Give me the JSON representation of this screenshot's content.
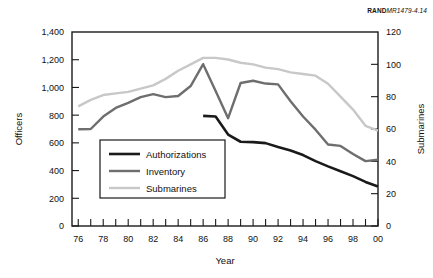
{
  "source_credit": {
    "bold": "RAND",
    "italic": "MR1479-4.14"
  },
  "chart_data": {
    "type": "line",
    "title": "",
    "subtitle": "",
    "xlabel": "Year",
    "ylabel": "Officers",
    "y2label": "Submarines",
    "grid": false,
    "legend_position": "inside-lower-left",
    "xlim": [
      76,
      100.5
    ],
    "ylim": [
      0,
      1400
    ],
    "y2lim": [
      0,
      120
    ],
    "x_tick_step": 1,
    "x_label_step": 2,
    "x_tick_labels": [
      "76",
      "77",
      "78",
      "79",
      "80",
      "81",
      "82",
      "83",
      "84",
      "85",
      "86",
      "87",
      "88",
      "89",
      "90",
      "91",
      "92",
      "93",
      "94",
      "95",
      "96",
      "97",
      "98",
      "99",
      "00"
    ],
    "x_tick_values": [
      76,
      77,
      78,
      79,
      80,
      81,
      82,
      83,
      84,
      85,
      86,
      87,
      88,
      89,
      90,
      91,
      92,
      93,
      94,
      95,
      96,
      97,
      98,
      99,
      100
    ],
    "x_labeled_values": [
      76,
      78,
      80,
      82,
      84,
      86,
      88,
      90,
      92,
      94,
      96,
      98,
      100
    ],
    "y_ticks": [
      0,
      200,
      400,
      600,
      800,
      1000,
      1200,
      1400
    ],
    "y_tick_labels": [
      "0",
      "200",
      "400",
      "600",
      "800",
      "1,000",
      "1,200",
      "1,400"
    ],
    "y2_ticks": [
      0,
      20,
      40,
      60,
      80,
      100,
      120
    ],
    "y2_tick_labels": [
      "0",
      "20",
      "40",
      "60",
      "80",
      "100",
      "120"
    ],
    "series": [
      {
        "name": "Authorizations",
        "color": "#1a1a1a",
        "width": 2.6,
        "axis": "left",
        "x": [
          86.5,
          87.5,
          88.5,
          89.5,
          90.5,
          91.5,
          92.5,
          93.5,
          94.5,
          95.5,
          96.5,
          97.5,
          98.5,
          99.5,
          100.5
        ],
        "values": [
          795,
          790,
          660,
          608,
          605,
          598,
          570,
          545,
          512,
          468,
          430,
          395,
          360,
          318,
          285
        ]
      },
      {
        "name": "Inventory",
        "color": "#6e6e6e",
        "width": 2.4,
        "axis": "left",
        "x": [
          76.5,
          77.5,
          78.5,
          79.5,
          80.5,
          81.5,
          82.5,
          83.5,
          84.5,
          85.5,
          86.5,
          87.5,
          88.5,
          89.5,
          90.5,
          91.5,
          92.5,
          93.5,
          94.5,
          95.5,
          96.5,
          97.5,
          98.5,
          99.5,
          100.5
        ],
        "values": [
          698,
          700,
          790,
          852,
          888,
          930,
          952,
          930,
          938,
          1010,
          1168,
          975,
          778,
          1032,
          1048,
          1028,
          1022,
          900,
          790,
          695,
          588,
          578,
          520,
          468,
          478
        ]
      },
      {
        "name": "Submarines",
        "color": "#c8c8c8",
        "width": 2.4,
        "axis": "right",
        "x": [
          76.5,
          77.5,
          78.5,
          79.5,
          80.5,
          81.5,
          82.5,
          83.5,
          84.5,
          85.5,
          86.5,
          87.5,
          88.5,
          89.5,
          90.5,
          91.5,
          92.5,
          93.5,
          94.5,
          95.5,
          96.5,
          97.5,
          98.5,
          99.5,
          100.5
        ],
        "values": [
          74,
          78,
          81,
          82,
          83,
          85,
          87,
          91,
          96,
          100,
          104,
          104,
          103,
          101,
          100,
          98,
          97,
          95,
          94,
          93,
          88,
          80,
          72,
          62,
          59
        ]
      }
    ],
    "legend": [
      {
        "label": "Authorizations",
        "color": "#1a1a1a",
        "width": 2.6
      },
      {
        "label": "Inventory",
        "color": "#6e6e6e",
        "width": 2.4
      },
      {
        "label": "Submarines",
        "color": "#c8c8c8",
        "width": 2.4
      }
    ]
  }
}
